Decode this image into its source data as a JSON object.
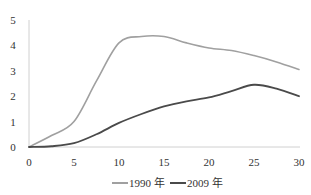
{
  "chart_data": {
    "type": "line",
    "title": "",
    "xlabel": "",
    "ylabel": "",
    "x": [
      0,
      2.5,
      5,
      7.5,
      10,
      12.5,
      15,
      17.5,
      20,
      22.5,
      25,
      27.5,
      30
    ],
    "series": [
      {
        "name": "1990 年",
        "color": "#a0a0a0",
        "values": [
          0,
          0.45,
          1.0,
          2.6,
          4.1,
          4.35,
          4.35,
          4.1,
          3.9,
          3.8,
          3.6,
          3.35,
          3.05
        ]
      },
      {
        "name": "2009 年",
        "color": "#4a4a4a",
        "values": [
          0,
          0.03,
          0.15,
          0.5,
          0.95,
          1.3,
          1.6,
          1.8,
          1.95,
          2.2,
          2.45,
          2.3,
          2.0
        ]
      }
    ],
    "xlim": [
      0,
      30
    ],
    "ylim": [
      0,
      5
    ],
    "xticks": [
      0,
      5,
      10,
      15,
      20,
      25,
      30
    ],
    "yticks": [
      0,
      1,
      2,
      3,
      4,
      5
    ],
    "grid": false,
    "legend_position": "bottom"
  },
  "axes": {
    "x_tick_labels": [
      "0",
      "5",
      "10",
      "15",
      "20",
      "25",
      "30"
    ],
    "y_tick_labels": [
      "0",
      "1",
      "2",
      "3",
      "4",
      "5"
    ]
  },
  "legend": {
    "items": [
      {
        "label": "1990 年",
        "color": "#a0a0a0"
      },
      {
        "label": "2009 年",
        "color": "#4a4a4a"
      }
    ]
  }
}
